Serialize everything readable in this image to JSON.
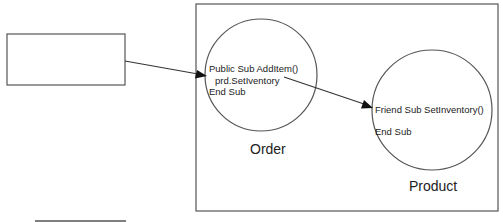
{
  "diagram": {
    "type": "object-collaboration",
    "external_box": {
      "label": ""
    },
    "container_box": {
      "label": ""
    },
    "objects": [
      {
        "name": "Order",
        "code_lines": [
          "Public Sub AddItem()",
          "  prd.SetIventory",
          "End Sub"
        ]
      },
      {
        "name": "Product",
        "code_lines": [
          "Friend Sub SetInventory()",
          "",
          "End Sub"
        ]
      }
    ],
    "connections": [
      {
        "from": "external_box",
        "to": "Order",
        "label": ""
      },
      {
        "from": "Order.prd.SetIventory",
        "to": "Product",
        "label": ""
      }
    ],
    "colors": {
      "stroke": "#555555",
      "arrow": "#111111",
      "text": "#222222",
      "background": "#ffffff"
    }
  }
}
